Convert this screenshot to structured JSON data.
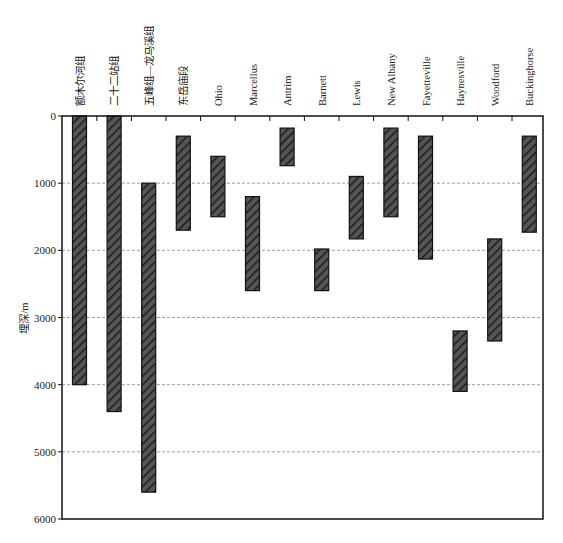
{
  "chart_data": {
    "type": "bar",
    "subtype": "floating-range-bar (depth intervals)",
    "title": "",
    "xlabel": "",
    "ylabel": "埋深/m",
    "ylim": [
      0,
      6000
    ],
    "y_inverted": true,
    "yticks": [
      0,
      1000,
      2000,
      3000,
      4000,
      5000,
      6000
    ],
    "grid": {
      "horizontal": true,
      "style": "dashed",
      "color": "#9a9a9a"
    },
    "legend": null,
    "categories": [
      "额木尔河组",
      "二十二站组",
      "五峰组—龙马溪组",
      "东岳庙段",
      "Ohio",
      "Marcellus",
      "Antrim",
      "Barnett",
      "Lewis",
      "New Albany",
      "Fayetteville",
      "Haynesville",
      "Woodford",
      "Buckinghorse"
    ],
    "series": [
      {
        "name": "埋深范围",
        "ranges": [
          [
            0,
            4000
          ],
          [
            0,
            4400
          ],
          [
            1000,
            5600
          ],
          [
            300,
            1700
          ],
          [
            600,
            1500
          ],
          [
            1200,
            2600
          ],
          [
            180,
            740
          ],
          [
            1980,
            2600
          ],
          [
            900,
            1830
          ],
          [
            180,
            1500
          ],
          [
            300,
            2130
          ],
          [
            3200,
            4100
          ],
          [
            1830,
            3350
          ],
          [
            300,
            1730
          ]
        ],
        "fill": "hatched dark gray",
        "color": "#3a3a3a"
      }
    ]
  },
  "style": {
    "bar_fill": "#4a4a4a",
    "hatch_stroke": "#1a1a1a",
    "axis_color": "#111111",
    "grid_color": "#a0a0a0"
  }
}
